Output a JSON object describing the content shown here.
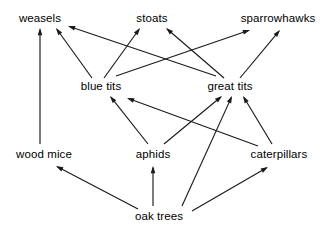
{
  "diagram": {
    "type": "food-web",
    "width": 325,
    "height": 234,
    "background_color": "#ffffff",
    "line_color": "#1a1a1a",
    "text_color": "#000000",
    "nodes": [
      {
        "id": "weasels",
        "label": "weasels",
        "x": 40,
        "y": 18,
        "trophic_level": "predator"
      },
      {
        "id": "stoats",
        "label": "stoats",
        "x": 152,
        "y": 18,
        "trophic_level": "predator"
      },
      {
        "id": "sparrowhawks",
        "label": "sparrowhawks",
        "x": 278,
        "y": 18,
        "trophic_level": "predator"
      },
      {
        "id": "blue_tits",
        "label": "blue tits",
        "x": 101,
        "y": 86,
        "trophic_level": "secondary-consumer"
      },
      {
        "id": "great_tits",
        "label": "great tits",
        "x": 230,
        "y": 86,
        "trophic_level": "secondary-consumer"
      },
      {
        "id": "wood_mice",
        "label": "wood mice",
        "x": 44,
        "y": 154,
        "trophic_level": "primary-consumer"
      },
      {
        "id": "aphids",
        "label": "aphids",
        "x": 153,
        "y": 154,
        "trophic_level": "primary-consumer"
      },
      {
        "id": "caterpillars",
        "label": "caterpillars",
        "x": 279,
        "y": 154,
        "trophic_level": "primary-consumer"
      },
      {
        "id": "oak_trees",
        "label": "oak trees",
        "x": 159,
        "y": 216,
        "trophic_level": "producer"
      }
    ],
    "edges": [
      {
        "from": "wood_mice",
        "to": "weasels",
        "x1": 40,
        "y1": 144,
        "x2": 40,
        "y2": 28
      },
      {
        "from": "blue_tits",
        "to": "weasels",
        "x1": 92,
        "y1": 78,
        "x2": 56,
        "y2": 28
      },
      {
        "from": "blue_tits",
        "to": "stoats",
        "x1": 104,
        "y1": 78,
        "x2": 140,
        "y2": 28
      },
      {
        "from": "blue_tits",
        "to": "sparrowhawks",
        "x1": 116,
        "y1": 76,
        "x2": 250,
        "y2": 30
      },
      {
        "from": "great_tits",
        "to": "weasels",
        "x1": 216,
        "y1": 76,
        "x2": 68,
        "y2": 26
      },
      {
        "from": "great_tits",
        "to": "stoats",
        "x1": 224,
        "y1": 78,
        "x2": 166,
        "y2": 28
      },
      {
        "from": "great_tits",
        "to": "sparrowhawks",
        "x1": 240,
        "y1": 78,
        "x2": 280,
        "y2": 30
      },
      {
        "from": "aphids",
        "to": "blue_tits",
        "x1": 148,
        "y1": 144,
        "x2": 110,
        "y2": 96
      },
      {
        "from": "aphids",
        "to": "great_tits",
        "x1": 164,
        "y1": 144,
        "x2": 222,
        "y2": 96
      },
      {
        "from": "caterpillars",
        "to": "blue_tits",
        "x1": 258,
        "y1": 146,
        "x2": 127,
        "y2": 98
      },
      {
        "from": "caterpillars",
        "to": "great_tits",
        "x1": 272,
        "y1": 144,
        "x2": 243,
        "y2": 96
      },
      {
        "from": "oak_trees",
        "to": "great_tits",
        "x1": 182,
        "y1": 206,
        "x2": 232,
        "y2": 96
      },
      {
        "from": "oak_trees",
        "to": "wood_mice",
        "x1": 138,
        "y1": 209,
        "x2": 56,
        "y2": 166
      },
      {
        "from": "oak_trees",
        "to": "aphids",
        "x1": 153,
        "y1": 206,
        "x2": 153,
        "y2": 166
      },
      {
        "from": "oak_trees",
        "to": "caterpillars",
        "x1": 192,
        "y1": 211,
        "x2": 268,
        "y2": 167
      }
    ]
  }
}
